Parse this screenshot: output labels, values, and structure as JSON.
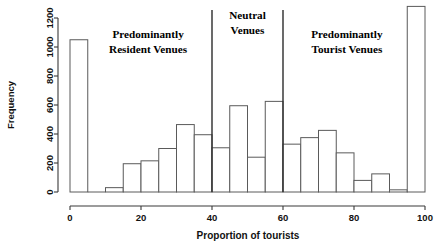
{
  "chart_data": {
    "type": "bar",
    "title": "",
    "xlabel": "Proportion of tourists",
    "ylabel": "Frequency",
    "xlim": [
      0,
      100
    ],
    "ylim": [
      0,
      1280
    ],
    "grid": false,
    "legend": "none",
    "binwidth": 5,
    "xticks": [
      "0",
      "20",
      "40",
      "60",
      "80",
      "100"
    ],
    "xtick_values": [
      0,
      20,
      40,
      60,
      80,
      100
    ],
    "yticks": [
      "0",
      "200",
      "400",
      "600",
      "800",
      "1000",
      "1200"
    ],
    "ytick_values": [
      0,
      200,
      400,
      600,
      800,
      1000,
      1200
    ],
    "bin_starts": [
      0,
      5,
      10,
      15,
      20,
      25,
      30,
      35,
      40,
      45,
      50,
      55,
      60,
      65,
      70,
      75,
      80,
      85,
      90,
      95
    ],
    "bin_ends": [
      5,
      10,
      15,
      20,
      25,
      30,
      35,
      40,
      45,
      50,
      55,
      60,
      65,
      70,
      75,
      80,
      85,
      90,
      95,
      100
    ],
    "categories": [
      "0-5",
      "5-10",
      "10-15",
      "15-20",
      "20-25",
      "25-30",
      "30-35",
      "35-40",
      "40-45",
      "45-50",
      "50-55",
      "55-60",
      "60-65",
      "65-70",
      "70-75",
      "75-80",
      "80-85",
      "85-90",
      "90-95",
      "95-100"
    ],
    "values": [
      1050,
      0,
      30,
      195,
      215,
      300,
      465,
      395,
      305,
      595,
      240,
      625,
      330,
      375,
      425,
      270,
      80,
      125,
      15,
      1280
    ],
    "annotations": [
      {
        "text_line1": "Predominantly",
        "text_line2": "Resident Venues",
        "x_center": 22,
        "y_top": 1060
      },
      {
        "text_line1": "Neutral",
        "text_line2": "Venues",
        "x_center": 50,
        "y_top": 1190
      },
      {
        "text_line1": "Predominantly",
        "text_line2": "Tourist Venues",
        "x_center": 78,
        "y_top": 1060
      }
    ],
    "dividers": [
      40,
      60
    ],
    "bar_fill": "#ffffff",
    "bar_stroke": "#5a5a5a",
    "axis_color": "#3a3a3a",
    "divider_color": "#2b2b2b"
  }
}
